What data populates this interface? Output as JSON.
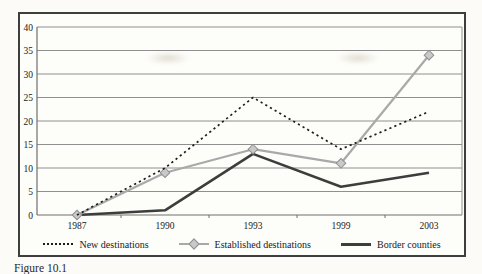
{
  "figure": {
    "caption": "Figure 10.1"
  },
  "chart_data": {
    "type": "line",
    "title": "",
    "xlabel": "",
    "ylabel": "",
    "categories": [
      "1987",
      "1990",
      "1993",
      "1999",
      "2003"
    ],
    "series": [
      {
        "name": "New destinations",
        "style": "dotted-black",
        "values": [
          0,
          10,
          25,
          14,
          22
        ]
      },
      {
        "name": "Established destinations",
        "style": "gray-diamond",
        "values": [
          0,
          9,
          14,
          11,
          34
        ]
      },
      {
        "name": "Border counties",
        "style": "solid-dark",
        "values": [
          0,
          1,
          13,
          6,
          9
        ]
      }
    ],
    "ylim": [
      0,
      40
    ],
    "y_ticks": [
      0,
      5,
      10,
      15,
      20,
      25,
      30,
      35,
      40
    ],
    "grid": "horizontal",
    "legend_position": "bottom"
  },
  "colors": {
    "new_destinations": "#1c1c1c",
    "established_destinations": "#a9a9a9",
    "established_marker_fill": "#c9c9c9",
    "established_marker_edge": "#8f8f8f",
    "border_counties": "#3d3d3d",
    "grid": "#8f8f8f",
    "axis": "#6f6f6f",
    "frame": "#3e3e3e",
    "text": "#1a1a1a"
  }
}
